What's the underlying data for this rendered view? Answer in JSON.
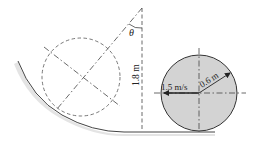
{
  "figure": {
    "labels": {
      "angle": "θ",
      "height": "1.8 m",
      "velocity": "1.5 m/s",
      "radius": "0.6 m"
    },
    "colors": {
      "disk_fill": "#d3d3d3",
      "line": "#333333",
      "ground_shadow": "#e2e2e2"
    }
  }
}
